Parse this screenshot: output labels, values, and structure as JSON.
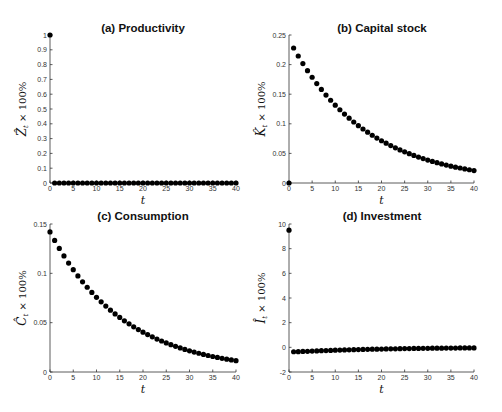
{
  "figure": {
    "panels": [
      {
        "id": "a",
        "title": "(a) Productivity",
        "ylabel_var": "Ẑ",
        "ylabel_sub": "t",
        "ylabel_suffix": " × 100%",
        "xlabel": "t"
      },
      {
        "id": "b",
        "title": "(b) Capital stock",
        "ylabel_var": "K̂",
        "ylabel_sub": "t",
        "ylabel_suffix": " × 100%",
        "xlabel": "t"
      },
      {
        "id": "c",
        "title": "(c) Consumption",
        "ylabel_var": "Ĉ",
        "ylabel_sub": "t",
        "ylabel_suffix": " × 100%",
        "xlabel": "t"
      },
      {
        "id": "d",
        "title": "(d) Investment",
        "ylabel_var": "Î",
        "ylabel_sub": "t",
        "ylabel_suffix": " × 100%",
        "xlabel": "t"
      }
    ]
  },
  "chart_data": [
    {
      "type": "scatter",
      "title": "(a) Productivity",
      "xlabel": "t",
      "ylabel": "Ẑ_t × 100%",
      "xlim": [
        0,
        40
      ],
      "ylim": [
        0,
        1
      ],
      "xticks": [
        0,
        5,
        10,
        15,
        20,
        25,
        30,
        35,
        40
      ],
      "yticks": [
        0,
        0.1,
        0.2,
        0.3,
        0.4,
        0.5,
        0.6,
        0.7,
        0.8,
        0.9,
        1
      ],
      "ytick_labels": [
        "0",
        "0.1",
        "0.2",
        "0.3",
        "0.4",
        "0.5",
        "0.6",
        "0.7",
        "0.8",
        "0.9",
        "1"
      ],
      "grid": false,
      "x": [
        0,
        1,
        2,
        3,
        4,
        5,
        6,
        7,
        8,
        9,
        10,
        11,
        12,
        13,
        14,
        15,
        16,
        17,
        18,
        19,
        20,
        21,
        22,
        23,
        24,
        25,
        26,
        27,
        28,
        29,
        30,
        31,
        32,
        33,
        34,
        35,
        36,
        37,
        38,
        39,
        40
      ],
      "y": [
        1,
        0,
        0,
        0,
        0,
        0,
        0,
        0,
        0,
        0,
        0,
        0,
        0,
        0,
        0,
        0,
        0,
        0,
        0,
        0,
        0,
        0,
        0,
        0,
        0,
        0,
        0,
        0,
        0,
        0,
        0,
        0,
        0,
        0,
        0,
        0,
        0,
        0,
        0,
        0,
        0
      ]
    },
    {
      "type": "scatter",
      "title": "(b) Capital stock",
      "xlabel": "t",
      "ylabel": "K̂_t × 100%",
      "xlim": [
        0,
        40
      ],
      "ylim": [
        0,
        0.25
      ],
      "xticks": [
        0,
        5,
        10,
        15,
        20,
        25,
        30,
        35,
        40
      ],
      "yticks": [
        0,
        0.05,
        0.1,
        0.15,
        0.2,
        0.25
      ],
      "ytick_labels": [
        "0",
        "0.05",
        "0.1",
        "0.15",
        "0.2",
        "0.25"
      ],
      "grid": false,
      "x": [
        0,
        1,
        2,
        3,
        4,
        5,
        6,
        7,
        8,
        9,
        10,
        11,
        12,
        13,
        14,
        15,
        16,
        17,
        18,
        19,
        20,
        21,
        22,
        23,
        24,
        25,
        26,
        27,
        28,
        29,
        30,
        31,
        32,
        33,
        34,
        35,
        36,
        37,
        38,
        39,
        40
      ],
      "y": [
        0,
        0.228,
        0.2145,
        0.2018,
        0.1898,
        0.1786,
        0.168,
        0.158,
        0.1486,
        0.1398,
        0.1315,
        0.1237,
        0.1164,
        0.1095,
        0.103,
        0.0969,
        0.0912,
        0.0858,
        0.0807,
        0.0759,
        0.0714,
        0.0672,
        0.0632,
        0.0594,
        0.0559,
        0.0526,
        0.0495,
        0.0465,
        0.0438,
        0.0412,
        0.0387,
        0.0364,
        0.0343,
        0.0323,
        0.0303,
        0.0285,
        0.0268,
        0.0253,
        0.0238,
        0.0224,
        0.021
      ]
    },
    {
      "type": "scatter",
      "title": "(c) Consumption",
      "xlabel": "t",
      "ylabel": "Ĉ_t × 100%",
      "xlim": [
        0,
        40
      ],
      "ylim": [
        0,
        0.15
      ],
      "xticks": [
        0,
        5,
        10,
        15,
        20,
        25,
        30,
        35,
        40
      ],
      "yticks": [
        0,
        0.05,
        0.1,
        0.15
      ],
      "ytick_labels": [
        "0",
        "0.05",
        "0.1",
        "0.15"
      ],
      "grid": false,
      "x": [
        0,
        1,
        2,
        3,
        4,
        5,
        6,
        7,
        8,
        9,
        10,
        11,
        12,
        13,
        14,
        15,
        16,
        17,
        18,
        19,
        20,
        21,
        22,
        23,
        24,
        25,
        26,
        27,
        28,
        29,
        30,
        31,
        32,
        33,
        34,
        35,
        36,
        37,
        38,
        39,
        40
      ],
      "y": [
        0.142,
        0.1334,
        0.1252,
        0.1176,
        0.1104,
        0.1037,
        0.0974,
        0.0914,
        0.0859,
        0.0806,
        0.0757,
        0.0711,
        0.0668,
        0.0627,
        0.0589,
        0.0553,
        0.0519,
        0.0488,
        0.0458,
        0.043,
        0.0404,
        0.0379,
        0.0356,
        0.0334,
        0.0314,
        0.0295,
        0.0277,
        0.026,
        0.0244,
        0.0229,
        0.0215,
        0.0202,
        0.019,
        0.0178,
        0.0167,
        0.0157,
        0.0148,
        0.0139,
        0.013,
        0.0122,
        0.0115
      ]
    },
    {
      "type": "scatter",
      "title": "(d) Investment",
      "xlabel": "t",
      "ylabel": "Î_t × 100%",
      "xlim": [
        0,
        40
      ],
      "ylim": [
        -2,
        10
      ],
      "xticks": [
        0,
        5,
        10,
        15,
        20,
        25,
        30,
        35,
        40
      ],
      "yticks": [
        -2,
        0,
        2,
        4,
        6,
        8,
        10
      ],
      "ytick_labels": [
        "-2",
        "0",
        "2",
        "4",
        "6",
        "8",
        "10"
      ],
      "grid": false,
      "x": [
        0,
        1,
        2,
        3,
        4,
        5,
        6,
        7,
        8,
        9,
        10,
        11,
        12,
        13,
        14,
        15,
        16,
        17,
        18,
        19,
        20,
        21,
        22,
        23,
        24,
        25,
        26,
        27,
        28,
        29,
        30,
        31,
        32,
        33,
        34,
        35,
        36,
        37,
        38,
        39,
        40
      ],
      "y": [
        9.5,
        -0.36,
        -0.35,
        -0.33,
        -0.32,
        -0.3,
        -0.29,
        -0.27,
        -0.26,
        -0.25,
        -0.23,
        -0.22,
        -0.21,
        -0.2,
        -0.19,
        -0.18,
        -0.17,
        -0.16,
        -0.15,
        -0.15,
        -0.14,
        -0.13,
        -0.12,
        -0.12,
        -0.11,
        -0.1,
        -0.1,
        -0.09,
        -0.09,
        -0.08,
        -0.08,
        -0.07,
        -0.07,
        -0.07,
        -0.06,
        -0.06,
        -0.06,
        -0.05,
        -0.05,
        -0.05,
        -0.05
      ]
    }
  ]
}
